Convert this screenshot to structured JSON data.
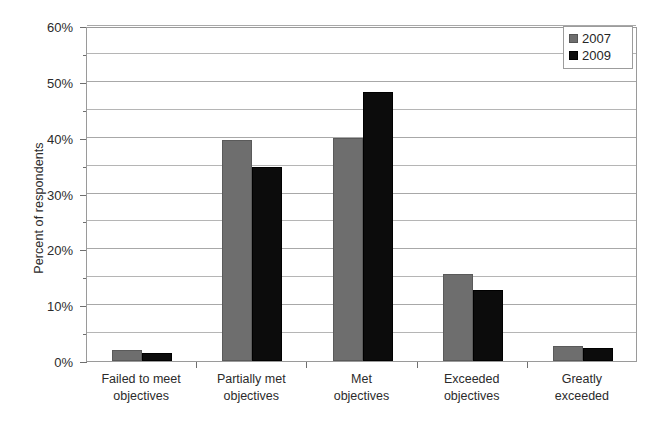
{
  "chart_data": {
    "type": "bar",
    "title": "",
    "subtitle": "",
    "xlabel": "",
    "ylabel": "Percent of respondents",
    "categories": [
      "Failed to meet\nobjectives",
      "Partially met\nobjectives",
      "Met\nobjectives",
      "Exceeded\nobjectives",
      "Greatly\nexceeded"
    ],
    "series": [
      {
        "name": "2007",
        "color": "#6e6e6e",
        "values": [
          2.0,
          39.6,
          40.0,
          15.5,
          2.7
        ]
      },
      {
        "name": "2009",
        "color": "#0c0c0c",
        "values": [
          1.5,
          34.7,
          48.2,
          12.8,
          2.3
        ]
      }
    ],
    "ylim": [
      0,
      60
    ],
    "ytick_labels": [
      "0%",
      "10%",
      "20%",
      "30%",
      "40%",
      "50%",
      "60%"
    ],
    "ytick_values": [
      0,
      10,
      20,
      30,
      40,
      50,
      60
    ],
    "minor_ytick_values": [
      5,
      15,
      25,
      35,
      45,
      55
    ],
    "value_suffix": "%",
    "grid": true,
    "grid_axis": "y",
    "grid_minor": true,
    "legend": true,
    "legend_position": "top-right",
    "legend_entries": [
      "2007",
      "2009"
    ],
    "bar_border": true,
    "background": "#ffffff",
    "axis_color": "#9a9a9a",
    "grid_color": "#a8a8a8",
    "text_color": "#2b2b2b"
  }
}
